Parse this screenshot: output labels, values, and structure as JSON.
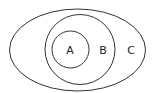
{
  "diagram": {
    "type": "nested-venn",
    "sets": [
      {
        "label": "A",
        "shape": "circle",
        "cx": 70.5,
        "cy": 49.5,
        "r": 18.5,
        "label_x": 70,
        "label_y": 50
      },
      {
        "label": "B",
        "shape": "circle",
        "cx": 80,
        "cy": 49.5,
        "r": 35,
        "label_x": 103,
        "label_y": 50
      },
      {
        "label": "C",
        "shape": "ellipse",
        "cx": 77.5,
        "cy": 50,
        "rx": 68,
        "ry": 41,
        "label_x": 131,
        "label_y": 50
      }
    ],
    "relationships": [
      "A ⊂ B",
      "B ⊂ C"
    ]
  }
}
